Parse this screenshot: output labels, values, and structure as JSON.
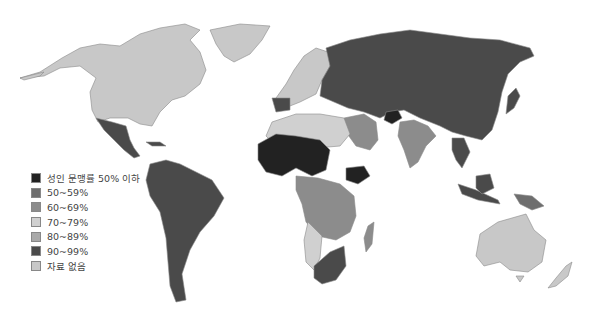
{
  "map": {
    "title": "",
    "type": "choropleth",
    "subject": "adult literacy rate by country",
    "colors": {
      "below50": "#222222",
      "r50_59": "#6e6e6e",
      "r60_69": "#8c8c8c",
      "r70_79": "#d0d0d0",
      "r80_89": "#a9a9a9",
      "r90_99": "#4a4a4a",
      "no_data": "#c8c8c8"
    }
  },
  "legend": {
    "items": [
      {
        "key": "below50",
        "label": "성인 문맹률 50% 이하",
        "color": "#222222"
      },
      {
        "key": "r50_59",
        "label": "50~59%",
        "color": "#6e6e6e"
      },
      {
        "key": "r60_69",
        "label": "60~69%",
        "color": "#8c8c8c"
      },
      {
        "key": "r70_79",
        "label": "70~79%",
        "color": "#d0d0d0"
      },
      {
        "key": "r80_89",
        "label": "80~89%",
        "color": "#a9a9a9"
      },
      {
        "key": "r90_99",
        "label": "90~99%",
        "color": "#4a4a4a"
      },
      {
        "key": "no_data",
        "label": "자료 없음",
        "color": "#c8c8c8"
      }
    ]
  },
  "regions": [
    {
      "name": "North America (USA, Canada)",
      "class": "no_data"
    },
    {
      "name": "Greenland",
      "class": "no_data"
    },
    {
      "name": "Mexico & Central America",
      "class": "r90_99"
    },
    {
      "name": "South America",
      "class": "r90_99"
    },
    {
      "name": "Western Europe",
      "class": "no_data"
    },
    {
      "name": "Spain / Portugal",
      "class": "r90_99"
    },
    {
      "name": "Russia & Central Asia",
      "class": "r90_99"
    },
    {
      "name": "China",
      "class": "r90_99"
    },
    {
      "name": "Afghanistan",
      "class": "below50"
    },
    {
      "name": "India",
      "class": "r60_69"
    },
    {
      "name": "Saudi Arabia / Middle East",
      "class": "r80_89"
    },
    {
      "name": "West Africa Sahel",
      "class": "below50"
    },
    {
      "name": "Ethiopia",
      "class": "below50"
    },
    {
      "name": "North Africa",
      "class": "r70_79"
    },
    {
      "name": "Southern Africa",
      "class": "r90_99"
    },
    {
      "name": "Central/East Africa",
      "class": "r60_69"
    },
    {
      "name": "Madagascar",
      "class": "r60_69"
    },
    {
      "name": "Southeast Asia / Indonesia",
      "class": "r90_99"
    },
    {
      "name": "Papua New Guinea",
      "class": "r50_59"
    },
    {
      "name": "Australia",
      "class": "no_data"
    },
    {
      "name": "New Zealand",
      "class": "no_data"
    }
  ]
}
